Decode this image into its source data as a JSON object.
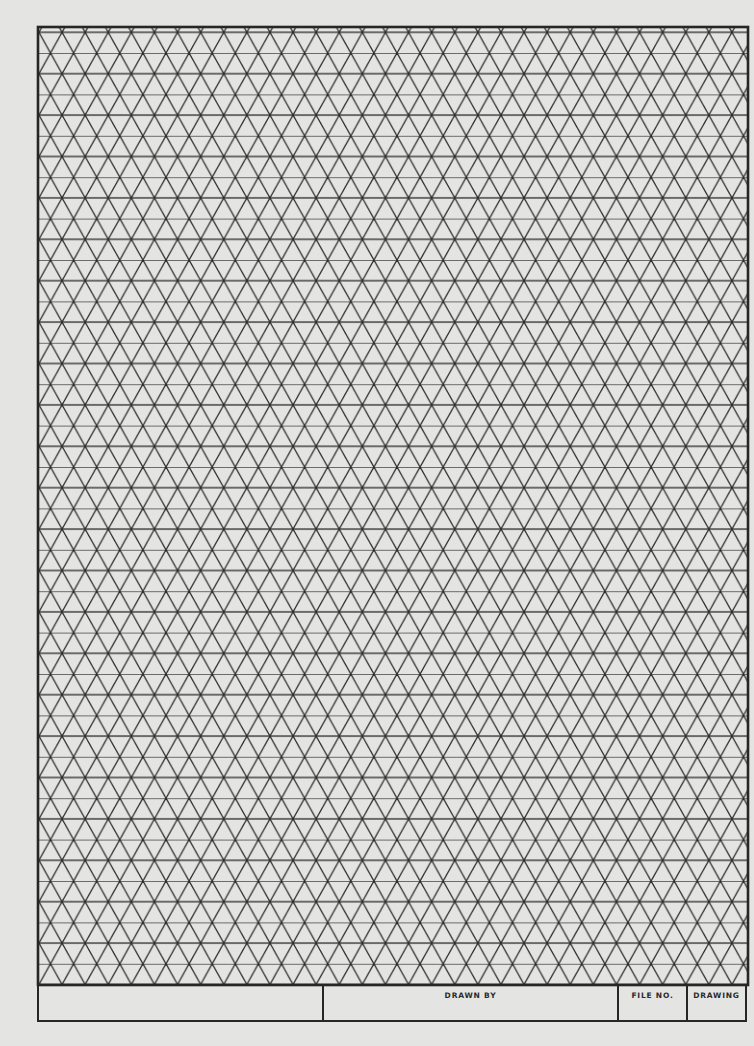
{
  "document": {
    "type": "isometric graph paper",
    "colors": {
      "paper": "#e4e4e2",
      "lines": "#2a2a2a"
    },
    "grid": {
      "pattern": "triangular (isometric)",
      "row_spacing_px": 20.7,
      "column_spacing_px": 23.1,
      "rows": 46,
      "columns": 31
    }
  },
  "title_block": {
    "cells": [
      {
        "label": ""
      },
      {
        "label": "DRAWN BY"
      },
      {
        "label": "FILE NO."
      },
      {
        "label": "DRAWING"
      }
    ]
  }
}
